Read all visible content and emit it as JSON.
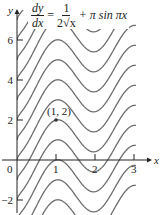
{
  "chart_data": {
    "type": "line",
    "equation": {
      "lhs_num": "dy",
      "lhs_den": "dx",
      "equals": "=",
      "rhs_num": "1",
      "rhs_den": "2√x",
      "plus_term": "+ π sin πx"
    },
    "solution_family": "y = √x − cos(πx) + C",
    "xlabel": "x",
    "ylabel": "y",
    "xlim": [
      0,
      3
    ],
    "ylim": [
      -2.3,
      7
    ],
    "x_ticks": [
      {
        "value": 0,
        "label": "0"
      },
      {
        "value": 1,
        "label": "1"
      },
      {
        "value": 2,
        "label": "2"
      },
      {
        "value": 3,
        "label": "3"
      }
    ],
    "y_ticks": [
      {
        "value": -2,
        "label": "−2"
      },
      {
        "value": 2,
        "label": "2"
      },
      {
        "value": 4,
        "label": "4"
      },
      {
        "value": 6,
        "label": "6"
      }
    ],
    "grid": false,
    "legend": null,
    "series": [
      {
        "name": "C=-4",
        "C": -4
      },
      {
        "name": "C=-3",
        "C": -3
      },
      {
        "name": "C=-2",
        "C": -2
      },
      {
        "name": "C=-1",
        "C": -1
      },
      {
        "name": "C=0 (through (1,2))",
        "C": 0
      },
      {
        "name": "C=1",
        "C": 1
      },
      {
        "name": "C=2",
        "C": 2
      },
      {
        "name": "C=3",
        "C": 3
      },
      {
        "name": "C=4",
        "C": 4
      },
      {
        "name": "C=5",
        "C": 5
      },
      {
        "name": "C=6",
        "C": 6
      },
      {
        "name": "C=7",
        "C": 7
      },
      {
        "name": "C=8",
        "C": 8
      }
    ],
    "annotations": [
      {
        "text": "(1, 2)",
        "x": 1,
        "y": 2,
        "marker": "point"
      }
    ]
  },
  "layout": {
    "origin_px": [
      17,
      160
    ],
    "px_per_x": 39,
    "px_per_y": 20,
    "x_axis_end_px": 148,
    "y_axis_top_px": 12,
    "curve_x_end": 3.05,
    "curve_color": "#6e6e6e"
  }
}
